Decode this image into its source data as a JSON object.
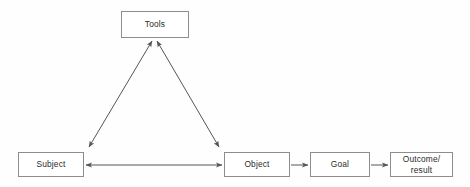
{
  "diagram": {
    "background_color": "#fefefe",
    "stroke_color": "#555555",
    "border_color": "#8d8d8d",
    "text_color": "#2b2b2b",
    "nodes": [
      {
        "id": "tools",
        "label": "Tools"
      },
      {
        "id": "subject",
        "label": "Subject"
      },
      {
        "id": "object",
        "label": "Object"
      },
      {
        "id": "goal",
        "label": "Goal"
      },
      {
        "id": "outcome",
        "label": "Outcome/\nresult"
      }
    ],
    "edges": [
      {
        "id": "subject-tools",
        "from": "Subject",
        "to": "Tools",
        "arrow": "double"
      },
      {
        "id": "tools-object",
        "from": "Tools",
        "to": "Object",
        "arrow": "double"
      },
      {
        "id": "subject-object",
        "from": "Subject",
        "to": "Object",
        "arrow": "double"
      },
      {
        "id": "object-goal",
        "from": "Object",
        "to": "Goal",
        "arrow": "single"
      },
      {
        "id": "goal-outcome",
        "from": "Goal",
        "to": "Outcome/result",
        "arrow": "single"
      }
    ]
  }
}
